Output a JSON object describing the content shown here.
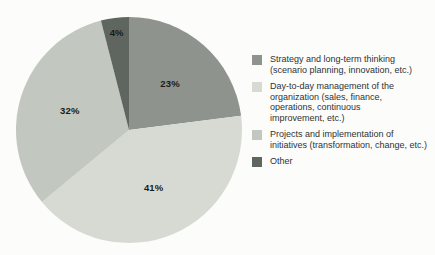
{
  "chart_data": {
    "type": "pie",
    "title": "",
    "unit": "%",
    "direction": "clockwise",
    "start_angle_deg": 0,
    "legend_position": "right",
    "background_color": "#fcfcfb",
    "value_label_color": "#1a1a1a",
    "legend_text_color": "#2e3336",
    "slices": [
      {
        "id": "strategy",
        "label": "Strategy and long-term thinking (scenario planning, innovation, etc.)",
        "legend_lines": [
          "Strategy and long-term thinking",
          "(scenario planning, innovation, etc.)"
        ],
        "value": 23,
        "display": "23%",
        "color": "#8e948d"
      },
      {
        "id": "day-to-day",
        "label": "Day-to-day management of the organization (sales, finance, operations, continuous improvement, etc.)",
        "legend_lines": [
          "Day-to-day management of the",
          "organization (sales, finance,",
          "operations, continuous",
          "improvement, etc.)"
        ],
        "value": 41,
        "display": "41%",
        "color": "#d7dad2"
      },
      {
        "id": "projects",
        "label": "Projects and implementation of initiatives (transformation, change, etc.)",
        "legend_lines": [
          "Projects and implementation of",
          "initiatives (transformation, change, etc.)"
        ],
        "value": 32,
        "display": "32%",
        "color": "#c2c7c0"
      },
      {
        "id": "other",
        "label": "Other",
        "legend_lines": [
          "Other"
        ],
        "value": 4,
        "display": "4%",
        "color": "#5f665f"
      }
    ]
  }
}
